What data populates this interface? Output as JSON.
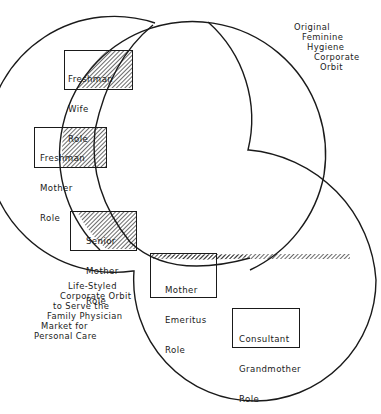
{
  "diagram": {
    "type": "overlapping-orbits",
    "orbits": [
      {
        "id": "feminine-hygiene",
        "label_lines": [
          "Original",
          "Feminine",
          "Hygiene",
          "Corporate",
          "Orbit"
        ]
      },
      {
        "id": "life-styled",
        "label_lines": [
          "Life-Styled",
          "Corporate Orbit",
          "to Serve the",
          "Family Physician",
          "Market for",
          "Personal Care"
        ]
      }
    ],
    "roles": [
      {
        "id": "freshman-wife",
        "lines": [
          "Freshman",
          "Wife",
          "Role"
        ]
      },
      {
        "id": "freshman-mother",
        "lines": [
          "Freshman",
          "Mother",
          "Role"
        ]
      },
      {
        "id": "senior-mother",
        "lines": [
          "Senior",
          "Mother",
          "Role"
        ]
      },
      {
        "id": "mother-emeritus",
        "lines": [
          "Mother",
          "Emeritus",
          "Role"
        ]
      },
      {
        "id": "consultant-grandmother",
        "lines": [
          "Consultant",
          "Grandmother",
          "Role"
        ]
      }
    ],
    "colors": {
      "line": "#1a1a1a",
      "background": "#ffffff"
    }
  }
}
